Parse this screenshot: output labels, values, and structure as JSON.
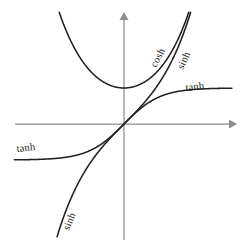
{
  "figure": {
    "background_color": "#ffffff",
    "curve_color": "#231f20",
    "axis_color": "#8d8d8d"
  },
  "axes": {
    "x_axis_name": "x-axis",
    "y_axis_name": "y-axis",
    "origin_px": {
      "x": 124,
      "y": 124
    },
    "unit_px": 36,
    "x_arrow": "right-arrowhead",
    "y_arrow": "up-arrowhead",
    "ticks": [],
    "tick_labels": [],
    "grid": false,
    "x_axis_label": "",
    "y_axis_label": ""
  },
  "labels": [
    {
      "id": "cosh-label",
      "text": "cosh",
      "x": 160,
      "y": 62,
      "rotation": -62
    },
    {
      "id": "sinh-label-top",
      "text": "sinh",
      "x": 186,
      "y": 64,
      "rotation": -66
    },
    {
      "id": "tanh-label-right",
      "text": "tanh",
      "x": 188,
      "y": 90,
      "rotation": -7
    },
    {
      "id": "tanh-label-left",
      "text": "tanh",
      "x": 18,
      "y": 151,
      "rotation": -7
    },
    {
      "id": "sinh-label-bottom",
      "text": "sinh",
      "x": 70,
      "y": 228,
      "rotation": -68
    }
  ],
  "chart_data": {
    "type": "line",
    "xlabel": "",
    "ylabel": "",
    "xlim": [
      -3.05,
      3.05
    ],
    "ylim": [
      -3.1,
      3.1
    ],
    "grid": false,
    "legend": "inline-curve-labels",
    "x": [
      -3,
      -2.75,
      -2.5,
      -2.25,
      -2,
      -1.75,
      -1.5,
      -1.25,
      -1,
      -0.75,
      -0.5,
      -0.25,
      0,
      0.25,
      0.5,
      0.75,
      1,
      1.25,
      1.5,
      1.75,
      2,
      2.25,
      2.5,
      2.75,
      3
    ],
    "series": [
      {
        "name": "sinh",
        "label": "sinh",
        "values": [
          -10.018,
          -7.789,
          -6.05,
          -4.691,
          -3.627,
          -2.79,
          -2.129,
          -1.602,
          -1.175,
          -0.822,
          -0.521,
          -0.253,
          0,
          0.253,
          0.521,
          0.822,
          1.175,
          1.602,
          2.129,
          2.79,
          3.627,
          4.691,
          6.05,
          7.789,
          10.018
        ]
      },
      {
        "name": "cosh",
        "label": "cosh",
        "values": [
          10.068,
          7.853,
          6.132,
          4.797,
          3.762,
          2.964,
          2.352,
          1.888,
          1.543,
          1.295,
          1.128,
          1.031,
          1,
          1.031,
          1.128,
          1.295,
          1.543,
          1.888,
          2.352,
          2.964,
          3.762,
          4.797,
          6.132,
          7.853,
          10.068
        ]
      },
      {
        "name": "tanh",
        "label": "tanh",
        "values": [
          -0.995,
          -0.992,
          -0.987,
          -0.978,
          -0.964,
          -0.941,
          -0.905,
          -0.848,
          -0.762,
          -0.635,
          -0.462,
          -0.245,
          0,
          0.245,
          0.462,
          0.635,
          0.762,
          0.848,
          0.905,
          0.941,
          0.964,
          0.978,
          0.987,
          0.992,
          0.995
        ]
      }
    ],
    "annotations": [
      {
        "text": "cosh",
        "attached_to": "cosh"
      },
      {
        "text": "sinh",
        "attached_to": "sinh"
      },
      {
        "text": "tanh",
        "attached_to": "tanh"
      },
      {
        "text": "tanh",
        "attached_to": "tanh"
      },
      {
        "text": "sinh",
        "attached_to": "sinh"
      }
    ]
  }
}
